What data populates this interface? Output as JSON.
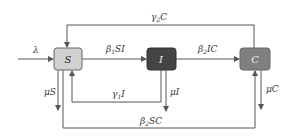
{
  "diagram": {
    "type": "compartment-flow",
    "nodes": [
      {
        "id": "S",
        "label": "S",
        "fill": "#d0d0d0",
        "text_color": "#222222"
      },
      {
        "id": "I",
        "label": "I",
        "fill": "#444444",
        "text_color": "#eeeeee"
      },
      {
        "id": "C",
        "label": "C",
        "fill": "#808080",
        "text_color": "#eeeeee"
      }
    ],
    "edges": {
      "lambda": {
        "label": "λ",
        "from": "outside",
        "to": "S"
      },
      "beta1SI": {
        "label_main": "β",
        "label_sub": "1",
        "label_rest": "SI",
        "from": "S",
        "to": "I"
      },
      "beta2IC": {
        "label_main": "β",
        "label_sub": "2",
        "label_rest": "IC",
        "from": "I",
        "to": "C"
      },
      "gamma2C": {
        "label_main": "γ",
        "label_sub": "2",
        "label_rest": "C",
        "from": "C",
        "to": "S"
      },
      "gamma1I": {
        "label_main": "γ",
        "label_sub": "1",
        "label_rest": "I",
        "from": "I",
        "to": "S"
      },
      "beta2SC": {
        "label_main": "β",
        "label_sub": "2",
        "label_rest": "SC",
        "from": "S",
        "to": "C"
      },
      "muS": {
        "label": "μS",
        "from": "S",
        "to": "outside"
      },
      "muI": {
        "label": "μI",
        "from": "I",
        "to": "outside"
      },
      "muC": {
        "label": "μC",
        "from": "C",
        "to": "outside"
      }
    },
    "line_color": "#555555"
  }
}
